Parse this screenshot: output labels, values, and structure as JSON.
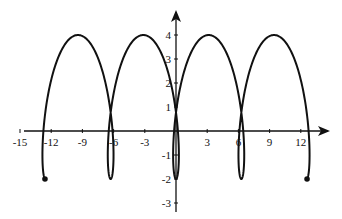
{
  "chart_data": {
    "type": "line",
    "title": "",
    "xlabel": "",
    "ylabel": "",
    "x_ticks": [
      -15,
      -12,
      -9,
      -6,
      -3,
      3,
      6,
      9,
      12
    ],
    "y_ticks": [
      4,
      3,
      2,
      1,
      -1,
      -2,
      -3
    ],
    "xlim": [
      -15.5,
      14.5
    ],
    "ylim": [
      -3.2,
      4.6
    ],
    "grid": false,
    "legend": null,
    "series": [
      {
        "name": "curve",
        "param": "t",
        "t_range": [
          -12.566,
          12.566
        ],
        "x_expr": "t - 1.5*sin(t)",
        "y_expr": "1 - 3*cos(t)",
        "key_points": [
          {
            "x": -12.6,
            "y": -2,
            "note": "start point (dot)"
          },
          {
            "x": -9.4,
            "y": 4
          },
          {
            "x": -6.3,
            "y": -2
          },
          {
            "x": -3.1,
            "y": 4
          },
          {
            "x": 0,
            "y": -2
          },
          {
            "x": 3.1,
            "y": 4
          },
          {
            "x": 6.3,
            "y": -2
          },
          {
            "x": 9.4,
            "y": 4
          },
          {
            "x": 12.6,
            "y": -2,
            "note": "end point (dot)"
          }
        ]
      }
    ],
    "endpoints": [
      {
        "x": -12.6,
        "y": -2
      },
      {
        "x": 12.6,
        "y": -2
      }
    ]
  },
  "axes": {
    "x_tick_labels": [
      "-15",
      "-12",
      "-9",
      "-6",
      "-3",
      "3",
      "6",
      "9",
      "12"
    ],
    "y_tick_labels": [
      "4",
      "3",
      "2",
      "1",
      "-1",
      "-2",
      "-3"
    ]
  }
}
